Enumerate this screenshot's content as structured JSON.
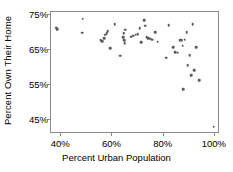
{
  "chart_data": {
    "type": "scatter",
    "title": "",
    "xlabel": "Percent Urban Population",
    "ylabel": "Percent Own Their Home",
    "xlim": [
      36,
      102
    ],
    "ylim": [
      41,
      76
    ],
    "xticks": [
      40,
      60,
      80,
      100
    ],
    "xtick_labels": [
      "40%",
      "60%",
      "80%",
      "100%"
    ],
    "yticks": [
      45,
      55,
      65,
      75
    ],
    "ytick_labels": [
      "45%",
      "55%",
      "65%",
      "75%"
    ],
    "grid": false,
    "legend": null,
    "marker": {
      "shape": "circle",
      "color": "#5b5b5b",
      "size_px": 2.6
    },
    "frame_color": "#8a8a8a",
    "background": "#ffffff",
    "points": [
      {
        "x": 38.5,
        "y": 71.2
      },
      {
        "x": 38.8,
        "y": 70.8
      },
      {
        "x": 48.8,
        "y": 73.8
      },
      {
        "x": 48.5,
        "y": 69.8
      },
      {
        "x": 55.8,
        "y": 67.6
      },
      {
        "x": 56.5,
        "y": 67.4
      },
      {
        "x": 57.2,
        "y": 68.2
      },
      {
        "x": 57.6,
        "y": 69.2
      },
      {
        "x": 58.2,
        "y": 69.6
      },
      {
        "x": 58.6,
        "y": 70.2
      },
      {
        "x": 59.4,
        "y": 65.4
      },
      {
        "x": 61.2,
        "y": 72.2
      },
      {
        "x": 63.4,
        "y": 63.2
      },
      {
        "x": 64.5,
        "y": 68.4
      },
      {
        "x": 64.8,
        "y": 69.6
      },
      {
        "x": 65.0,
        "y": 67.6
      },
      {
        "x": 65.2,
        "y": 66.8
      },
      {
        "x": 65.4,
        "y": 70.6
      },
      {
        "x": 67.8,
        "y": 68.6
      },
      {
        "x": 68.6,
        "y": 68.9
      },
      {
        "x": 69.4,
        "y": 69.2
      },
      {
        "x": 70.2,
        "y": 69.4
      },
      {
        "x": 71.0,
        "y": 71.0
      },
      {
        "x": 71.6,
        "y": 67.0
      },
      {
        "x": 72.8,
        "y": 73.4
      },
      {
        "x": 73.2,
        "y": 71.8
      },
      {
        "x": 73.8,
        "y": 68.4
      },
      {
        "x": 74.4,
        "y": 68.2
      },
      {
        "x": 75.2,
        "y": 68.0
      },
      {
        "x": 76.0,
        "y": 67.8
      },
      {
        "x": 77.2,
        "y": 70.0
      },
      {
        "x": 78.0,
        "y": 67.2
      },
      {
        "x": 81.4,
        "y": 62.6
      },
      {
        "x": 82.4,
        "y": 72.0
      },
      {
        "x": 84.2,
        "y": 65.6
      },
      {
        "x": 85.0,
        "y": 64.2
      },
      {
        "x": 85.8,
        "y": 64.0
      },
      {
        "x": 86.6,
        "y": 67.6
      },
      {
        "x": 87.0,
        "y": 67.8
      },
      {
        "x": 87.4,
        "y": 67.6
      },
      {
        "x": 87.8,
        "y": 66.0
      },
      {
        "x": 88.0,
        "y": 53.6
      },
      {
        "x": 88.6,
        "y": 67.8
      },
      {
        "x": 89.4,
        "y": 70.0
      },
      {
        "x": 89.8,
        "y": 60.4
      },
      {
        "x": 90.6,
        "y": 63.4
      },
      {
        "x": 91.2,
        "y": 57.6
      },
      {
        "x": 91.8,
        "y": 72.2
      },
      {
        "x": 92.4,
        "y": 59.0
      },
      {
        "x": 93.2,
        "y": 65.6
      },
      {
        "x": 94.2,
        "y": 56.2
      },
      {
        "x": 100.0,
        "y": 42.8
      }
    ]
  },
  "axes": {
    "ylabel_text": "Percent Own Their Home",
    "xlabel_text": "Percent Urban Population"
  }
}
